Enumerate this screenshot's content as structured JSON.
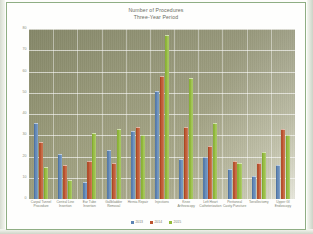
{
  "chart_data": {
    "type": "bar",
    "title": "Number of Procedures",
    "subtitle": "Three-Year Period",
    "title_lines": [
      "Number of Procedures",
      "Three-Year Period"
    ],
    "xlabel": "",
    "ylabel": "",
    "ylim": [
      0,
      80
    ],
    "yticks": [
      0,
      10,
      20,
      30,
      40,
      50,
      60,
      70,
      80
    ],
    "ytick_labels": [
      "0",
      "10",
      "20",
      "30",
      "40",
      "50",
      "60",
      "70",
      "80"
    ],
    "grid": "horizontal-and-vertical",
    "legend_position": "bottom",
    "categories": [
      "Carpal Tunnel Procedure",
      "Central Line Insertion",
      "Ear Tube Insertion",
      "Gallbladder Removal",
      "Hernia Repair",
      "Injections",
      "Knee Arthroscopy",
      "Left Heart Catheterization",
      "Peritoneal Cavity Puncture",
      "Tonsillectomy",
      "Upper GI Endoscopy"
    ],
    "category_lines": [
      [
        "Carpal Tunnel",
        "Procedure"
      ],
      [
        "Central Line",
        "Insertion"
      ],
      [
        "Ear Tube",
        "Insertion"
      ],
      [
        "Gallbladder",
        "Removal"
      ],
      [
        "Hernia Repair"
      ],
      [
        "Injections"
      ],
      [
        "Knee",
        "Arthroscopy"
      ],
      [
        "Left Heart",
        "Catheterization"
      ],
      [
        "Peritoneal",
        "Cavity Puncture"
      ],
      [
        "Tonsillectomy"
      ],
      [
        "Upper GI",
        "Endoscopy"
      ]
    ],
    "series": [
      {
        "name": "2013",
        "color": "#5d84b4",
        "values": [
          36,
          21,
          8,
          23,
          32,
          51,
          19,
          20,
          14,
          11,
          16
        ]
      },
      {
        "name": "2014",
        "color": "#bd5430",
        "values": [
          27,
          16,
          18,
          17,
          34,
          58,
          34,
          25,
          18,
          17,
          33
        ]
      },
      {
        "name": "2015",
        "color": "#93bb3c",
        "values": [
          15,
          9,
          31,
          33,
          30,
          77,
          57,
          36,
          17,
          22,
          30
        ]
      }
    ]
  },
  "legend": {
    "items": [
      {
        "label": "2013",
        "color": "#5d84b4"
      },
      {
        "label": "2014",
        "color": "#bd5430"
      },
      {
        "label": "2015",
        "color": "#93bb3c"
      }
    ]
  }
}
